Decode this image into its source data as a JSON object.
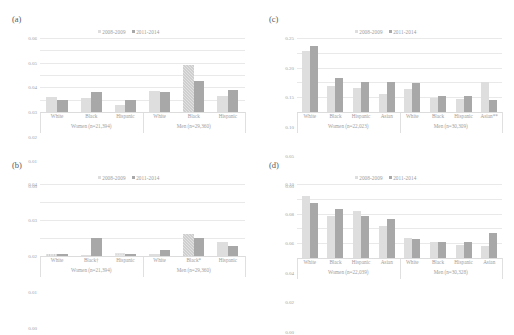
{
  "figure": {
    "background": "#ffffff",
    "series_colors": [
      "#dedede",
      "#a8a8a8"
    ],
    "legend": [
      "2008-2009",
      "2011-2014"
    ]
  },
  "panels": [
    {
      "id": "a",
      "letter": "(a)",
      "legend": [
        "2008-2009",
        "2011-2014"
      ],
      "chart_data": {
        "type": "bar",
        "title": "",
        "xlabel": "",
        "ylabel": "",
        "ylim": [
          0,
          0.06
        ],
        "yticks": [
          "0.06",
          "0.05",
          "0.04",
          "0.03",
          "0.02",
          "0.01",
          "0.00"
        ],
        "grid": true,
        "legend_position": "top-center",
        "groups": [
          {
            "name": "Women (n=21,394)",
            "categories": [
              "White",
              "Black",
              "Hispanic"
            ],
            "series": [
              {
                "name": "2008-2009",
                "values": [
                  0.012,
                  0.011,
                  0.006
                ]
              },
              {
                "name": "2011-2014",
                "values": [
                  0.0095,
                  0.016,
                  0.01
                ]
              }
            ]
          },
          {
            "name": "Men (n=29,360)",
            "categories": [
              "White",
              "Black",
              "Hispanic"
            ],
            "series": [
              {
                "name": "2008-2009",
                "values": [
                  0.017,
                  0.038,
                  0.013
                ]
              },
              {
                "name": "2011-2014",
                "values": [
                  0.016,
                  0.025,
                  0.018
                ]
              }
            ]
          }
        ]
      }
    },
    {
      "id": "b",
      "letter": "(b)",
      "legend": [
        "2008-2009",
        "2011-2014"
      ],
      "chart_data": {
        "type": "bar",
        "title": "",
        "xlabel": "",
        "ylabel": "",
        "ylim": [
          0,
          0.04
        ],
        "yticks": [
          "0.04",
          "0.03",
          "0.02",
          "0.01",
          "0.00"
        ],
        "grid": true,
        "legend_position": "top-center",
        "groups": [
          {
            "name": "Women (n=21,394)",
            "categories": [
              "White",
              "Black†",
              "Hispanic"
            ],
            "series": [
              {
                "name": "2008-2009",
                "values": [
                  0.0012,
                  0.0004,
                  0.0014
                ]
              },
              {
                "name": "2011-2014",
                "values": [
                  0.001,
                  0.0098,
                  0.0009
                ]
              }
            ]
          },
          {
            "name": "Men (n=29,360)",
            "categories": [
              "White",
              "Black*",
              "Hispanic"
            ],
            "series": [
              {
                "name": "2008-2009",
                "values": [
                  0.0009,
                  0.0122,
                  0.0078
                ]
              },
              {
                "name": "2011-2014",
                "values": [
                  0.0031,
                  0.0099,
                  0.0055
                ]
              }
            ]
          }
        ]
      }
    },
    {
      "id": "c",
      "letter": "(c)",
      "legend": [
        "2008-2009",
        "2011-2014"
      ],
      "chart_data": {
        "type": "bar",
        "title": "",
        "xlabel": "",
        "ylabel": "",
        "ylim": [
          0,
          0.25
        ],
        "yticks": [
          "0.25",
          "0.20",
          "0.15",
          "0.10",
          "0.05",
          "0.00"
        ],
        "grid": true,
        "legend_position": "top-center",
        "groups": [
          {
            "name": "Women (n=22,023)",
            "categories": [
              "White",
              "Black",
              "Hispanic",
              "Asian"
            ],
            "series": [
              {
                "name": "2008-2009",
                "values": [
                  0.205,
                  0.088,
                  0.081,
                  0.061
                ]
              },
              {
                "name": "2011-2014",
                "values": [
                  0.222,
                  0.114,
                  0.1,
                  0.1
                ]
              }
            ]
          },
          {
            "name": "Men (n=30,309)",
            "categories": [
              "White",
              "Black",
              "Hispanic",
              "Asian**"
            ],
            "series": [
              {
                "name": "2008-2009",
                "values": [
                  0.077,
                  0.048,
                  0.043,
                  0.101
                ]
              },
              {
                "name": "2011-2014",
                "values": [
                  0.098,
                  0.053,
                  0.055,
                  0.04
                ]
              }
            ]
          }
        ]
      }
    },
    {
      "id": "d",
      "letter": "(d)",
      "legend": [
        "2008-2009",
        "2011-2014"
      ],
      "chart_data": {
        "type": "bar",
        "title": "",
        "xlabel": "",
        "ylabel": "",
        "ylim": [
          0,
          0.1
        ],
        "yticks": [
          "0.10",
          "0.08",
          "0.06",
          "0.04",
          "0.02",
          "0.00"
        ],
        "grid": true,
        "legend_position": "top-center",
        "groups": [
          {
            "name": "Women (n=22,039)",
            "categories": [
              "White",
              "Black",
              "Hispanic",
              "Asian"
            ],
            "series": [
              {
                "name": "2008-2009",
                "values": [
                  0.084,
                  0.057,
                  0.063,
                  0.043
                ]
              },
              {
                "name": "2011-2014",
                "values": [
                  0.074,
                  0.066,
                  0.057,
                  0.053
                ]
              }
            ]
          },
          {
            "name": "Men (n=30,328)",
            "categories": [
              "White",
              "Black",
              "Hispanic",
              "Asian"
            ],
            "series": [
              {
                "name": "2008-2009",
                "values": [
                  0.027,
                  0.022,
                  0.018,
                  0.016
                ]
              },
              {
                "name": "2011-2014",
                "values": [
                  0.026,
                  0.022,
                  0.021,
                  0.034
                ]
              }
            ]
          }
        ]
      }
    }
  ]
}
